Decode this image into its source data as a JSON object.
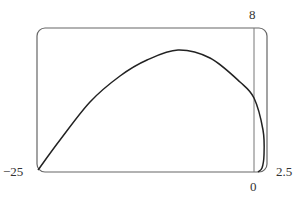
{
  "chart_data": {
    "type": "line",
    "title": "",
    "xlabel": "",
    "ylabel": "",
    "xlim": [
      -25,
      2.5
    ],
    "ylim": [
      0,
      8
    ],
    "grid": false,
    "legend": null,
    "tick_labels": {
      "x_min": "−25",
      "x_max": "2.5",
      "x_origin": "0",
      "y_max": "8"
    },
    "series": [
      {
        "name": "parametric curve",
        "x": [
          -25,
          -22.4,
          -18.8,
          -15.2,
          -12.0,
          -8.3,
          -4.5,
          -0.9,
          0,
          1.1,
          1.2,
          1.0,
          0.5,
          0
        ],
        "y": [
          0.1,
          1.8,
          3.9,
          5.3,
          6.2,
          6.8,
          6.3,
          5.0,
          4.1,
          2.3,
          0.95,
          0.2,
          0,
          0
        ]
      }
    ],
    "pixel_frame": {
      "left": 37,
      "top": 28,
      "right": 267,
      "bottom": 172,
      "y_axis_x": 254
    },
    "curve_pixels": [
      [
        38,
        170
      ],
      [
        60,
        140
      ],
      [
        90,
        102
      ],
      [
        120,
        76
      ],
      [
        147,
        60
      ],
      [
        178,
        50
      ],
      [
        210,
        58
      ],
      [
        240,
        82
      ],
      [
        254,
        98
      ],
      [
        263,
        130
      ],
      [
        264,
        155
      ],
      [
        262,
        168
      ],
      [
        258,
        172
      ]
    ]
  }
}
